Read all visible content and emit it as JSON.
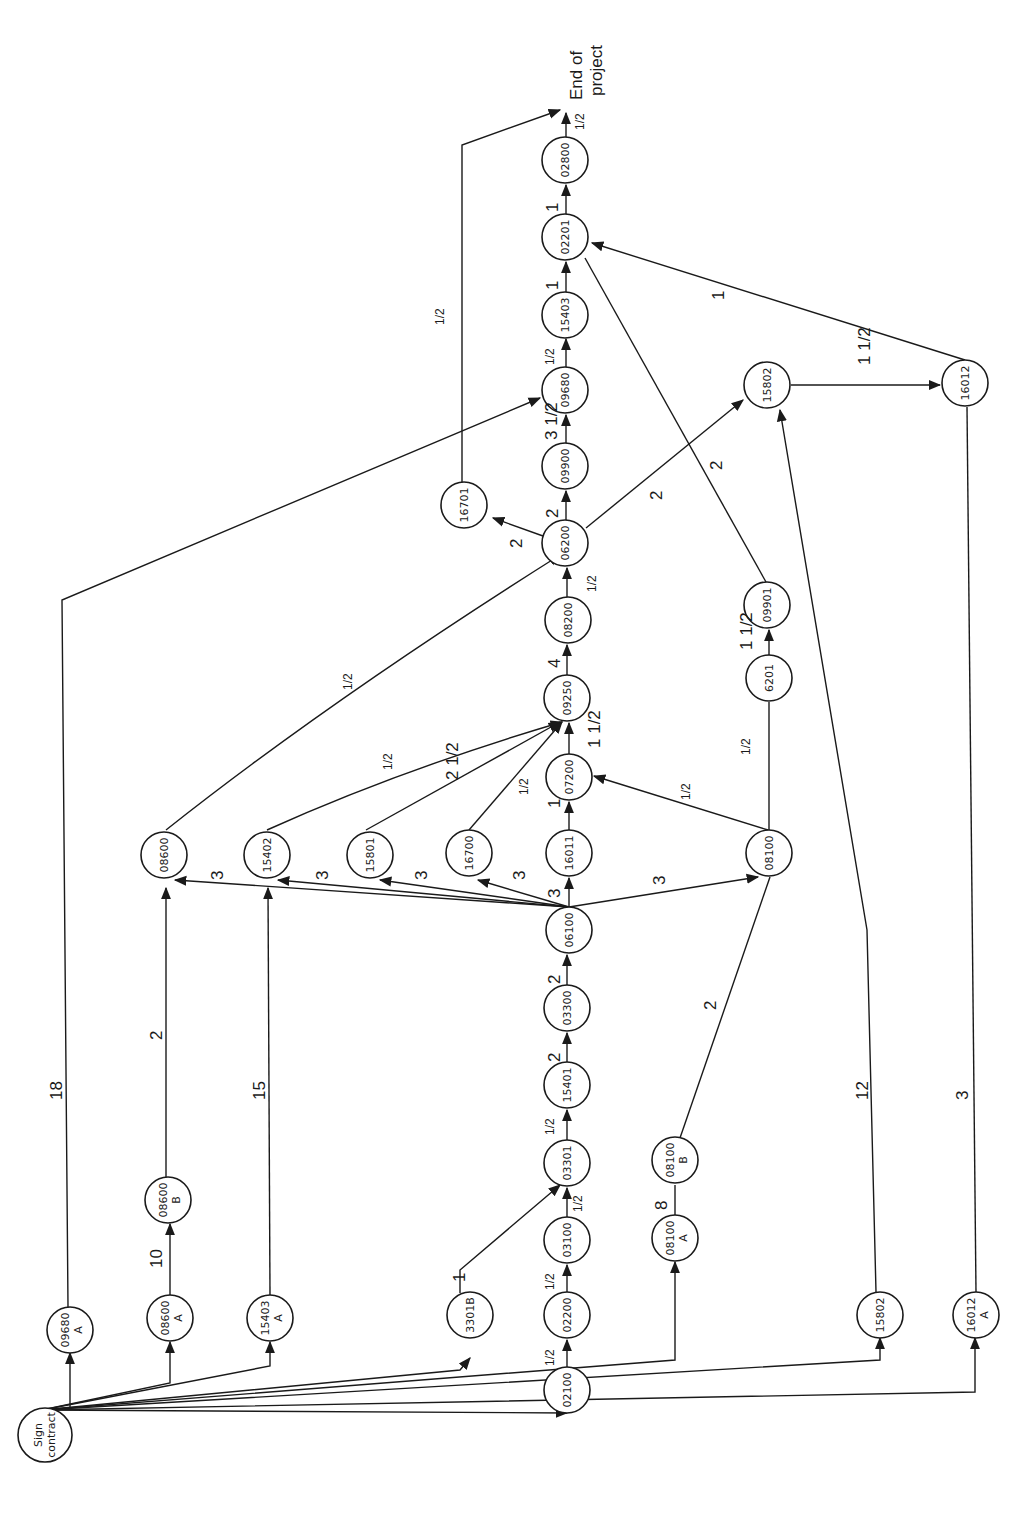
{
  "diagram": {
    "type": "activity-network",
    "orientation": "rotated-90-ccw",
    "start_node": "Sign contract",
    "end_label": "End of project",
    "nodes": [
      {
        "id": "sign",
        "label": "Sign contract",
        "x": 45,
        "y": 1435
      },
      {
        "id": "09680A",
        "label": "09680 A",
        "x": 70,
        "y": 1330
      },
      {
        "id": "08600A",
        "label": "08600 A",
        "x": 170,
        "y": 1318
      },
      {
        "id": "15403A",
        "label": "15403 A",
        "x": 270,
        "y": 1318
      },
      {
        "id": "3301B",
        "label": "3301B",
        "x": 470,
        "y": 1315
      },
      {
        "id": "02100",
        "label": "02100",
        "x": 567,
        "y": 1390
      },
      {
        "id": "02200",
        "label": "02200",
        "x": 567,
        "y": 1315
      },
      {
        "id": "03100",
        "label": "03100",
        "x": 567,
        "y": 1240
      },
      {
        "id": "03301",
        "label": "03301",
        "x": 567,
        "y": 1163
      },
      {
        "id": "15401",
        "label": "15401",
        "x": 567,
        "y": 1085
      },
      {
        "id": "03300",
        "label": "03300",
        "x": 567,
        "y": 1008
      },
      {
        "id": "06100",
        "label": "06100",
        "x": 569,
        "y": 930
      },
      {
        "id": "08100A",
        "label": "08100 A",
        "x": 675,
        "y": 1238
      },
      {
        "id": "08100B",
        "label": "08100 B",
        "x": 675,
        "y": 1160
      },
      {
        "id": "08600B",
        "label": "08600 B",
        "x": 168,
        "y": 1200
      },
      {
        "id": "15802A",
        "label": "15802",
        "x": 880,
        "y": 1315
      },
      {
        "id": "16012A",
        "label": "16012 A",
        "x": 980,
        "y": 1315
      },
      {
        "id": "08600",
        "label": "08600",
        "x": 164,
        "y": 855
      },
      {
        "id": "15402",
        "label": "15402",
        "x": 267,
        "y": 855
      },
      {
        "id": "15801",
        "label": "15801",
        "x": 370,
        "y": 855
      },
      {
        "id": "16700",
        "label": "16700",
        "x": 469,
        "y": 853
      },
      {
        "id": "16011",
        "label": "16011",
        "x": 569,
        "y": 853
      },
      {
        "id": "08100",
        "label": "08100",
        "x": 769,
        "y": 853
      },
      {
        "id": "07200",
        "label": "07200",
        "x": 569,
        "y": 777
      },
      {
        "id": "09250",
        "label": "09250",
        "x": 567,
        "y": 698
      },
      {
        "id": "08200",
        "label": "08200",
        "x": 568,
        "y": 620
      },
      {
        "id": "06200",
        "label": "06200",
        "x": 565,
        "y": 543
      },
      {
        "id": "16701",
        "label": "16701",
        "x": 464,
        "y": 505
      },
      {
        "id": "09900",
        "label": "09900",
        "x": 565,
        "y": 466
      },
      {
        "id": "09680",
        "label": "09680",
        "x": 565,
        "y": 390
      },
      {
        "id": "15403",
        "label": "15403",
        "x": 565,
        "y": 315
      },
      {
        "id": "02201",
        "label": "02201",
        "x": 565,
        "y": 237
      },
      {
        "id": "02800",
        "label": "02800",
        "x": 565,
        "y": 160
      },
      {
        "id": "6201",
        "label": "6201",
        "x": 769,
        "y": 678
      },
      {
        "id": "09901",
        "label": "09901",
        "x": 767,
        "y": 605
      },
      {
        "id": "15802",
        "label": "15802",
        "x": 767,
        "y": 385
      },
      {
        "id": "16012",
        "label": "16012",
        "x": 965,
        "y": 383
      }
    ],
    "edges": [
      {
        "from": "sign",
        "to": "09680A",
        "duration": ""
      },
      {
        "from": "sign",
        "to": "08600A",
        "duration": ""
      },
      {
        "from": "sign",
        "to": "15403A",
        "duration": ""
      },
      {
        "from": "sign",
        "to": "3301B",
        "duration": ""
      },
      {
        "from": "sign",
        "to": "02100",
        "duration": ""
      },
      {
        "from": "sign",
        "to": "08100A",
        "duration": ""
      },
      {
        "from": "sign",
        "to": "15802A",
        "duration": ""
      },
      {
        "from": "sign",
        "to": "16012A",
        "duration": ""
      },
      {
        "from": "02100",
        "to": "02200",
        "duration": "1/2"
      },
      {
        "from": "02200",
        "to": "03100",
        "duration": "1/2"
      },
      {
        "from": "03100",
        "to": "03301",
        "duration": "1/2"
      },
      {
        "from": "3301B",
        "to": "03301",
        "duration": "1"
      },
      {
        "from": "03301",
        "to": "15401",
        "duration": "1/2"
      },
      {
        "from": "15401",
        "to": "03300",
        "duration": "2"
      },
      {
        "from": "03300",
        "to": "06100",
        "duration": "2"
      },
      {
        "from": "08100A",
        "to": "08100B",
        "duration": "8"
      },
      {
        "from": "08100B",
        "to": "08100",
        "duration": "2"
      },
      {
        "from": "08600A",
        "to": "08600B",
        "duration": "10"
      },
      {
        "from": "08600B",
        "to": "08600",
        "duration": "2"
      },
      {
        "from": "15403A",
        "to": "15402",
        "duration": "15"
      },
      {
        "from": "09680A",
        "to": "09680",
        "duration": "18"
      },
      {
        "from": "15802A",
        "to": "15802",
        "duration": "12"
      },
      {
        "from": "16012A",
        "to": "16012",
        "duration": "3"
      },
      {
        "from": "06100",
        "to": "08600",
        "duration": "3"
      },
      {
        "from": "06100",
        "to": "15402",
        "duration": "3"
      },
      {
        "from": "06100",
        "to": "15801",
        "duration": "3"
      },
      {
        "from": "06100",
        "to": "16700",
        "duration": "3"
      },
      {
        "from": "06100",
        "to": "16011",
        "duration": "3"
      },
      {
        "from": "06100",
        "to": "08100",
        "duration": "3"
      },
      {
        "from": "08600",
        "to": "06200",
        "duration": "1/2"
      },
      {
        "from": "15402",
        "to": "09250",
        "duration": "1/2"
      },
      {
        "from": "15801",
        "to": "09250",
        "duration": "2 1/2"
      },
      {
        "from": "16700",
        "to": "09250",
        "duration": "1/2"
      },
      {
        "from": "16011",
        "to": "07200",
        "duration": "1"
      },
      {
        "from": "08100",
        "to": "07200",
        "duration": "1/2"
      },
      {
        "from": "07200",
        "to": "09250",
        "duration": "1 1/2"
      },
      {
        "from": "08100",
        "to": "6201",
        "duration": "1/2"
      },
      {
        "from": "6201",
        "to": "09901",
        "duration": "1 1/2"
      },
      {
        "from": "09901",
        "to": "02201",
        "duration": "2"
      },
      {
        "from": "09250",
        "to": "08200",
        "duration": "4"
      },
      {
        "from": "08200",
        "to": "06200",
        "duration": "1/2"
      },
      {
        "from": "06200",
        "to": "16701",
        "duration": "2"
      },
      {
        "from": "06200",
        "to": "09900",
        "duration": "2"
      },
      {
        "from": "06200",
        "to": "15802",
        "duration": "2"
      },
      {
        "from": "09900",
        "to": "09680",
        "duration": "3 1/2"
      },
      {
        "from": "09680",
        "to": "15403",
        "duration": "1/2"
      },
      {
        "from": "15403",
        "to": "02201",
        "duration": "1"
      },
      {
        "from": "02201",
        "to": "02800",
        "duration": "1"
      },
      {
        "from": "02800",
        "to": "end",
        "duration": "1/2"
      },
      {
        "from": "16701",
        "to": "end",
        "duration": "1/2"
      },
      {
        "from": "15802",
        "to": "16012",
        "duration": "1 1/2"
      },
      {
        "from": "16012",
        "to": "02201",
        "duration": "1"
      }
    ],
    "labels": {
      "end_line1": "End of",
      "end_line2": "project",
      "sign_line1": "Sign",
      "sign_line2": "contract",
      "n_09680A_1": "09680",
      "n_09680A_2": "A",
      "n_08600A_1": "08600",
      "n_08600A_2": "A",
      "n_15403A_1": "15403",
      "n_15403A_2": "A",
      "n_3301B": "3301B",
      "n_02100": "02100",
      "n_02200": "02200",
      "n_03100": "03100",
      "n_03301": "03301",
      "n_15401": "15401",
      "n_03300": "03300",
      "n_06100": "06100",
      "n_08100A_1": "08100",
      "n_08100A_2": "A",
      "n_08100B_1": "08100",
      "n_08100B_2": "B",
      "n_08600B_1": "08600",
      "n_08600B_2": "B",
      "n_15802A": "15802",
      "n_16012A_1": "16012",
      "n_16012A_2": "A",
      "n_08600": "08600",
      "n_15402": "15402",
      "n_15801": "15801",
      "n_16700": "16700",
      "n_16011": "16011",
      "n_08100": "08100",
      "n_07200": "07200",
      "n_09250": "09250",
      "n_08200": "08200",
      "n_06200": "06200",
      "n_16701": "16701",
      "n_09900": "09900",
      "n_09680": "09680",
      "n_15403": "15403",
      "n_02201": "02201",
      "n_02800": "02800",
      "n_6201": "6201",
      "n_09901": "09901",
      "n_15802": "15802",
      "n_16012": "16012",
      "d_half": "1/2",
      "d_1": "1",
      "d_2": "2",
      "d_3": "3",
      "d_4": "4",
      "d_8": "8",
      "d_10": "10",
      "d_12": "12",
      "d_15": "15",
      "d_18": "18",
      "d_1half": "1 1/2",
      "d_2half": "2 1/2",
      "d_3half": "3 1/2"
    }
  }
}
